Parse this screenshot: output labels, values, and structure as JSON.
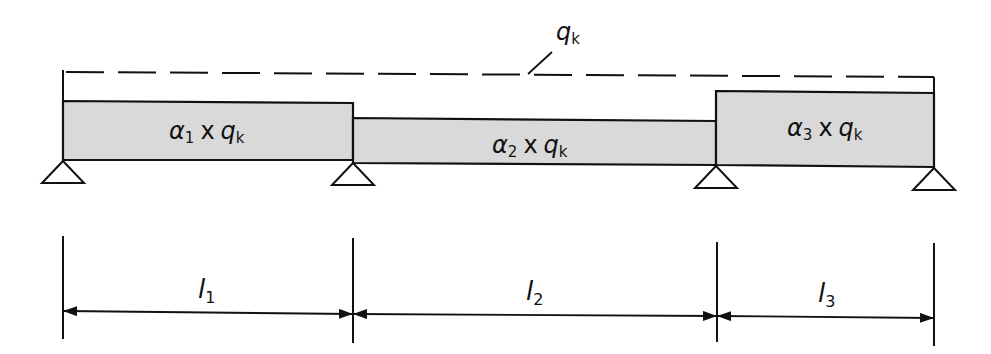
{
  "diagram": {
    "type": "continuous beam load diagram",
    "reference_load": {
      "symbol": "q",
      "subscript": "k"
    },
    "loads": [
      {
        "label_greek": "α",
        "index": "1",
        "op": "x",
        "symbol": "q",
        "subscript": "k"
      },
      {
        "label_greek": "α",
        "index": "2",
        "op": "x",
        "symbol": "q",
        "subscript": "k"
      },
      {
        "label_greek": "α",
        "index": "3",
        "op": "x",
        "symbol": "q",
        "subscript": "k"
      }
    ],
    "spans": [
      {
        "symbol": "l",
        "index": "1"
      },
      {
        "symbol": "l",
        "index": "2"
      },
      {
        "symbol": "l",
        "index": "3"
      }
    ],
    "supports_count": 4,
    "colors": {
      "load_fill": "#d9d9d9",
      "stroke": "#111111",
      "background": "#ffffff"
    }
  }
}
